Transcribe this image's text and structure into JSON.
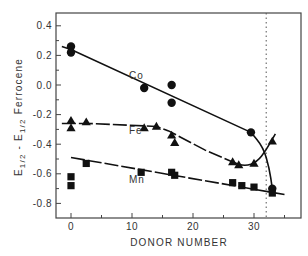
{
  "chart_data": {
    "type": "scatter",
    "title": "",
    "xlabel": "DONOR NUMBER",
    "ylabel": "E1/2 - E1/2 Ferrocene",
    "ylabel_parts": {
      "E1": "E",
      "sub1": "1/2",
      "dash": " - E",
      "sub2": "1/2",
      "tail": " Ferrocene"
    },
    "xlim": [
      -2.5,
      38
    ],
    "ylim": [
      -0.93,
      0.48
    ],
    "xticks": [
      0,
      10,
      20,
      30
    ],
    "xtick_labels": [
      "0",
      "10",
      "20",
      "30"
    ],
    "xminor_ticks": [
      5,
      15,
      25,
      35
    ],
    "yticks": [
      0.4,
      0.2,
      0.0,
      -0.2,
      -0.4,
      -0.6,
      -0.8
    ],
    "ytick_labels": [
      "0.4",
      "0.2",
      "0.0",
      "-0.2",
      "-0.4",
      "-0.6",
      "-0.8"
    ],
    "yminor_ticks": [
      0.3,
      0.1,
      -0.1,
      -0.3,
      -0.5,
      -0.7
    ],
    "grid": false,
    "legend": "inline labels",
    "vertical_reference_line": {
      "x": 32,
      "style": "dotted"
    },
    "series": [
      {
        "name": "Co",
        "marker": "circle",
        "label_pos": {
          "x": 9.5,
          "y": 0.04
        },
        "points": [
          {
            "x": 0,
            "y": 0.26
          },
          {
            "x": 0,
            "y": 0.22
          },
          {
            "x": 12,
            "y": -0.02
          },
          {
            "x": 16.5,
            "y": 0.0
          },
          {
            "x": 16.5,
            "y": -0.12
          },
          {
            "x": 29.5,
            "y": -0.32
          },
          {
            "x": 33,
            "y": -0.7
          }
        ],
        "fit_line": [
          [
            -1.5,
            0.26
          ],
          [
            0,
            0.24
          ],
          [
            29.5,
            -0.32
          ]
        ],
        "fit_curve": [
          [
            29.5,
            -0.32
          ],
          [
            31.5,
            -0.42
          ],
          [
            32.5,
            -0.56
          ],
          [
            33,
            -0.7
          ]
        ]
      },
      {
        "name": "Fe",
        "marker": "triangle",
        "label_pos": {
          "x": 9.5,
          "y": -0.33
        },
        "points": [
          {
            "x": 0,
            "y": -0.24
          },
          {
            "x": 0,
            "y": -0.29
          },
          {
            "x": 2.5,
            "y": -0.25
          },
          {
            "x": 12,
            "y": -0.29
          },
          {
            "x": 14,
            "y": -0.28
          },
          {
            "x": 16.5,
            "y": -0.34
          },
          {
            "x": 17,
            "y": -0.39
          },
          {
            "x": 26.5,
            "y": -0.52
          },
          {
            "x": 27.5,
            "y": -0.54
          },
          {
            "x": 30,
            "y": -0.53
          },
          {
            "x": 33,
            "y": -0.38
          }
        ],
        "fit_line": [
          [
            -1.5,
            -0.26
          ],
          [
            3,
            -0.26
          ],
          [
            14,
            -0.28
          ],
          [
            16,
            -0.31
          ],
          [
            22,
            -0.44
          ],
          [
            26.5,
            -0.52
          ]
        ],
        "fit_curve": [
          [
            26.5,
            -0.52
          ],
          [
            28.5,
            -0.55
          ],
          [
            30.5,
            -0.52
          ],
          [
            32,
            -0.44
          ],
          [
            33.5,
            -0.33
          ]
        ]
      },
      {
        "name": "Mn",
        "marker": "square",
        "label_pos": {
          "x": 9.5,
          "y": -0.66
        },
        "points": [
          {
            "x": 0,
            "y": -0.62
          },
          {
            "x": 0,
            "y": -0.68
          },
          {
            "x": 2.5,
            "y": -0.53
          },
          {
            "x": 11.5,
            "y": -0.59
          },
          {
            "x": 16.5,
            "y": -0.59
          },
          {
            "x": 17,
            "y": -0.61
          },
          {
            "x": 26.5,
            "y": -0.66
          },
          {
            "x": 28,
            "y": -0.68
          },
          {
            "x": 30,
            "y": -0.69
          },
          {
            "x": 33,
            "y": -0.73
          }
        ],
        "fit_line": [
          [
            0,
            -0.49
          ],
          [
            35,
            -0.74
          ]
        ]
      }
    ]
  },
  "colors": {
    "ink": "#111111",
    "axis": "#444444",
    "text": "#333333",
    "background": "#ffffff"
  }
}
